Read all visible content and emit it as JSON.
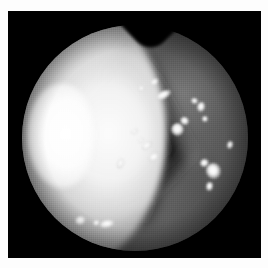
{
  "image": {
    "kind": "endoscopic-photograph",
    "modality": "laryngoscopy",
    "color_mode": "grayscale",
    "alt_text": "Grayscale endoscopic photograph: circular field of view with a bright white illuminated crescent along the left rim, a dark triangular glottic aperture through the centre, and scattered small specular highlights on the mucosal surface.",
    "width_px": 268,
    "height_px": 268,
    "page_background": "#ffffff",
    "plate_background": "#000000"
  },
  "plate": {
    "left": 8,
    "top": 11,
    "width": 253,
    "height": 247
  },
  "field_of_view": {
    "shape": "circle",
    "center_x": 127,
    "center_y": 127,
    "radius": 113,
    "rim_notch_present": true,
    "rim_notch_position": "top-center"
  },
  "regions": [
    {
      "name": "illuminated-crescent",
      "tone": "#ffffff",
      "location": "left"
    },
    {
      "name": "glottic-wedge",
      "tone": "#1b1b1b",
      "location": "center"
    },
    {
      "name": "mucosa-upper-right",
      "tone": "#7a7a7a",
      "location": "upper-right"
    },
    {
      "name": "mucosa-lower",
      "tone": "#6b6b6b",
      "location": "lower-center"
    },
    {
      "name": "vignette-rim",
      "tone": "#0a0a0a",
      "location": "perimeter"
    }
  ],
  "specular_highlights": [
    {
      "x": 146,
      "y": 71,
      "w": 9,
      "h": 6,
      "rot": -38
    },
    {
      "x": 155,
      "y": 84,
      "w": 17,
      "h": 8,
      "rot": -28
    },
    {
      "x": 133,
      "y": 77,
      "w": 7,
      "h": 5,
      "rot": -20
    },
    {
      "x": 186,
      "y": 90,
      "w": 7,
      "h": 6,
      "rot": 18
    },
    {
      "x": 193,
      "y": 96,
      "w": 8,
      "h": 10,
      "rot": 12
    },
    {
      "x": 197,
      "y": 108,
      "w": 6,
      "h": 6,
      "rot": -12
    },
    {
      "x": 176,
      "y": 110,
      "w": 9,
      "h": 8,
      "rot": 34
    },
    {
      "x": 169,
      "y": 118,
      "w": 13,
      "h": 13,
      "rot": 0
    },
    {
      "x": 126,
      "y": 120,
      "w": 7,
      "h": 5,
      "rot": -34
    },
    {
      "x": 133,
      "y": 129,
      "w": 6,
      "h": 5,
      "rot": -40
    },
    {
      "x": 139,
      "y": 134,
      "w": 12,
      "h": 7,
      "rot": -36
    },
    {
      "x": 146,
      "y": 146,
      "w": 12,
      "h": 8,
      "rot": -34
    },
    {
      "x": 112,
      "y": 152,
      "w": 7,
      "h": 11,
      "rot": 22
    },
    {
      "x": 196,
      "y": 152,
      "w": 9,
      "h": 8,
      "rot": -26
    },
    {
      "x": 205,
      "y": 160,
      "w": 15,
      "h": 16,
      "rot": -18
    },
    {
      "x": 201,
      "y": 175,
      "w": 7,
      "h": 9,
      "rot": 10
    },
    {
      "x": 222,
      "y": 134,
      "w": 6,
      "h": 8,
      "rot": 16
    },
    {
      "x": 72,
      "y": 209,
      "w": 11,
      "h": 9,
      "rot": -14
    },
    {
      "x": 88,
      "y": 212,
      "w": 7,
      "h": 6,
      "rot": -10
    },
    {
      "x": 99,
      "y": 213,
      "w": 16,
      "h": 8,
      "rot": -12
    }
  ]
}
